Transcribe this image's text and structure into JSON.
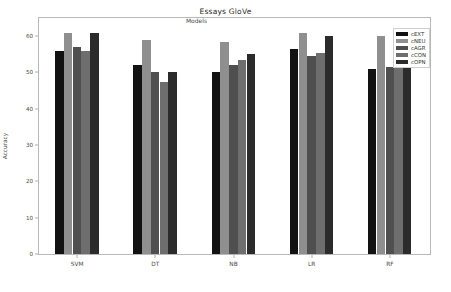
{
  "chart_data": {
    "type": "bar",
    "title": "Essays GloVe",
    "xlabel": "Models",
    "ylabel": "Accuracy",
    "categories": [
      "SVM",
      "DT",
      "NB",
      "LR",
      "RF"
    ],
    "series": [
      {
        "name": "cEXT",
        "color": "#121212",
        "values": [
          56.0,
          52.0,
          50.0,
          56.5,
          51.0
        ]
      },
      {
        "name": "cNEU",
        "color": "#8f8f8f",
        "values": [
          61.0,
          59.0,
          58.5,
          61.0,
          60.0
        ]
      },
      {
        "name": "cAGR",
        "color": "#4f4f4f",
        "values": [
          57.0,
          50.0,
          52.0,
          54.5,
          51.5
        ]
      },
      {
        "name": "cCON",
        "color": "#6e6e6e",
        "values": [
          56.0,
          47.5,
          53.5,
          55.5,
          51.5
        ]
      },
      {
        "name": "cOPN",
        "color": "#2b2b2b",
        "values": [
          61.0,
          50.0,
          55.0,
          60.0,
          52.0
        ]
      }
    ],
    "yticks": [
      0,
      10,
      20,
      30,
      40,
      50,
      60
    ],
    "ytick_labels": [
      "0",
      "10",
      "20",
      "30",
      "40",
      "50",
      "60"
    ],
    "ylim": [
      0,
      65
    ],
    "grid": false,
    "legend_position": "upper right",
    "background_color": "#ffffff",
    "axis_color": "#b8b8b8"
  }
}
